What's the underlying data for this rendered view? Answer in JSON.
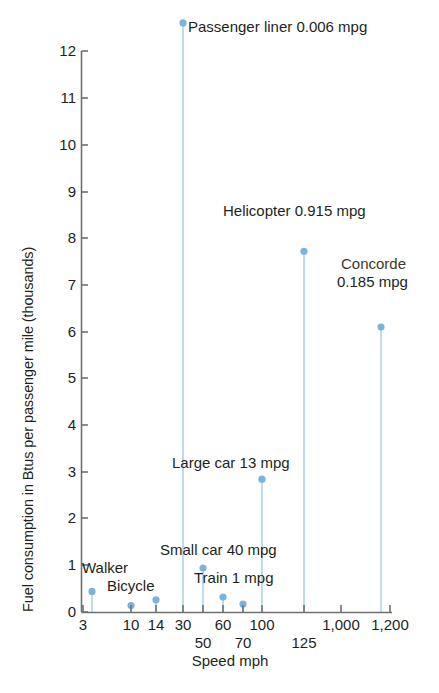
{
  "chart_data": {
    "type": "scatter",
    "title": "",
    "xlabel": "Speed mph",
    "ylabel": "Fuel consumption in Btus per passenger mile (thousands)",
    "ylim": [
      0,
      12.6
    ],
    "yticks": [
      "0",
      "1",
      "2",
      "3",
      "4",
      "5",
      "6",
      "7",
      "8",
      "9",
      "10",
      "11",
      "12"
    ],
    "xticks": [
      "3",
      "10",
      "14",
      "30",
      "50",
      "60",
      "70",
      "100",
      "125",
      "1,000",
      "1,200"
    ],
    "grid": false,
    "legend": "none",
    "marker_color": "#78b4df",
    "stem_color": "#a8d0ea",
    "axis_color": "#6f7072",
    "points": [
      {
        "label": "Walker",
        "speed": "3",
        "value": 0.45,
        "px": 92,
        "mpg": ""
      },
      {
        "label": "Bicycle",
        "speed": "10",
        "value": 0.15,
        "px": 131,
        "mpg": ""
      },
      {
        "label": "",
        "speed": "14",
        "value": 0.27,
        "px": 156,
        "mpg": ""
      },
      {
        "label": "Passenger liner",
        "speed": "30",
        "value": 12.6,
        "px": 183,
        "mpg": "0.006 mpg"
      },
      {
        "label": "Small car",
        "speed": "50",
        "value": 0.95,
        "px": 203,
        "mpg": "40 mpg"
      },
      {
        "label": "Train",
        "speed": "60",
        "value": 0.33,
        "px": 223,
        "mpg": "1 mpg"
      },
      {
        "label": "",
        "speed": "70",
        "value": 0.18,
        "px": 243,
        "mpg": ""
      },
      {
        "label": "Large car",
        "speed": "100",
        "value": 2.85,
        "px": 262,
        "mpg": "13 mpg"
      },
      {
        "label": "Helicopter",
        "speed": "125",
        "value": 7.72,
        "px": 304,
        "mpg": "0.915 mpg"
      },
      {
        "label": "Concorde",
        "speed": "1,200",
        "value": 6.1,
        "px": 381,
        "mpg": "0.185 mpg"
      }
    ],
    "annotations": [
      {
        "name": "passenger-liner",
        "text": "Passenger liner 0.006 mpg"
      },
      {
        "name": "helicopter",
        "text": "Helicopter 0.915 mpg"
      },
      {
        "name": "concorde-line1",
        "text": "Concorde"
      },
      {
        "name": "concorde-line2",
        "text": "0.185 mpg"
      },
      {
        "name": "large-car",
        "text": "Large car 13 mpg"
      },
      {
        "name": "small-car",
        "text": "Small car 40 mpg"
      },
      {
        "name": "train",
        "text": "Train 1 mpg"
      },
      {
        "name": "walker",
        "text": "Walker"
      },
      {
        "name": "bicycle",
        "text": "Bicycle"
      }
    ]
  },
  "axes": {
    "y_title": "Fuel consumption in Btus per passenger mile (thousands)",
    "x_title": "Speed mph",
    "y_ticks": [
      {
        "label": "12",
        "y": 51
      },
      {
        "label": "11",
        "y": 98
      },
      {
        "label": "10",
        "y": 145
      },
      {
        "label": "9",
        "y": 192
      },
      {
        "label": "8",
        "y": 238
      },
      {
        "label": "7",
        "y": 285
      },
      {
        "label": "6",
        "y": 332
      },
      {
        "label": "5",
        "y": 378
      },
      {
        "label": "4",
        "y": 425
      },
      {
        "label": "3",
        "y": 472
      },
      {
        "label": "2",
        "y": 518
      },
      {
        "label": "1",
        "y": 565
      },
      {
        "label": "0",
        "y": 612
      }
    ],
    "x_ticks_row1": [
      {
        "label": "3",
        "x": 83
      },
      {
        "label": "10",
        "x": 131
      },
      {
        "label": "14",
        "x": 156
      },
      {
        "label": "30",
        "x": 183
      },
      {
        "label": "60",
        "x": 223
      },
      {
        "label": "100",
        "x": 262
      },
      {
        "label": "1,000",
        "x": 341
      },
      {
        "label": "1,200",
        "x": 390
      }
    ],
    "x_ticks_row2": [
      {
        "label": "50",
        "x": 203
      },
      {
        "label": "70",
        "x": 243
      },
      {
        "label": "125",
        "x": 304
      }
    ]
  }
}
